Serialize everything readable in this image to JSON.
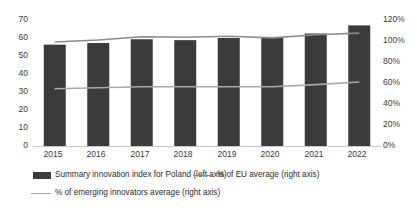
{
  "chart_data": {
    "type": "bar",
    "title": "",
    "subtitle": "",
    "xlabel": "",
    "ylabel": "",
    "categories": [
      "2015",
      "2016",
      "2017",
      "2018",
      "2019",
      "2020",
      "2021",
      "2022"
    ],
    "grid": false,
    "legend_position": "bottom",
    "axes": {
      "left": {
        "label": "",
        "min": 0,
        "max": 70,
        "step": 10,
        "ticks": [
          "0",
          "10",
          "20",
          "30",
          "40",
          "50",
          "60",
          "70"
        ]
      },
      "right": {
        "label": "",
        "min": 0,
        "max": 120,
        "step": 20,
        "ticks": [
          "0%",
          "20%",
          "40%",
          "60%",
          "80%",
          "100%",
          "120%"
        ]
      }
    },
    "series": [
      {
        "name": "Summary innovation index for Poland (left axis)",
        "type": "bar",
        "axis": "left",
        "color": "#3b3b3b",
        "values": [
          56.3,
          57.2,
          59.3,
          58.8,
          60.0,
          60.5,
          62.5,
          67.0
        ]
      },
      {
        "name": "% of EU average (right axis)",
        "type": "line",
        "axis": "right",
        "color": "#8c8c8c",
        "values": [
          99.0,
          101.0,
          104.0,
          103.5,
          104.5,
          103.0,
          106.0,
          107.5
        ]
      },
      {
        "name": "% of emerging innovators average (right axis)",
        "type": "line",
        "axis": "right",
        "color": "#a8a8a8",
        "values": [
          54.5,
          55.5,
          56.5,
          56.5,
          56.5,
          56.5,
          58.5,
          61.0
        ]
      }
    ]
  },
  "legend": {
    "items": [
      {
        "label": "Summary innovation index for Poland (left axis)",
        "marker": "bar-swatch"
      },
      {
        "label": "% of EU average (right axis)",
        "marker": "line-swatch"
      },
      {
        "label": "% of emerging innovators average (right axis)",
        "marker": "line-swatch-light"
      }
    ]
  },
  "colors": {
    "bar": "#3b3b3b",
    "eu_line": "#8c8c8c",
    "emerging_line": "#a8a8a8",
    "axis": "#c9c9c9",
    "text": "#2b2b2b",
    "background": "#ffffff"
  }
}
